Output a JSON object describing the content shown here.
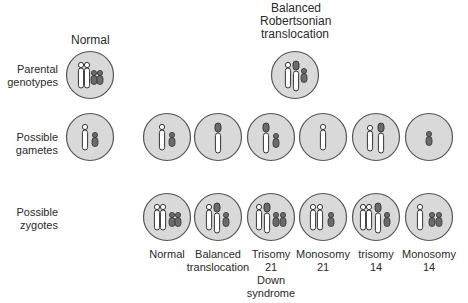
{
  "colors": {
    "background": "#ffffff",
    "cell_fill": "#d9d9d9",
    "cell_stroke": "#555555",
    "chr14_fill": "#ffffff",
    "chr21_fill": "#6b6b6b",
    "outline": "#333333"
  },
  "headers": {
    "normal": "Normal",
    "balanced_line1": "Balanced",
    "balanced_line2": "Robertsonian",
    "balanced_line3": "translocation"
  },
  "row_labels": {
    "parental_line1": "Parental",
    "parental_line2": "genotypes",
    "gametes_line1": "Possible",
    "gametes_line2": "gametes",
    "zygotes_line1": "Possible",
    "zygotes_line2": "zygotes"
  },
  "parents": [
    {
      "name": "normal",
      "chromosomes": [
        "14",
        "14",
        "21",
        "21"
      ]
    },
    {
      "name": "balanced-translocation",
      "chromosomes": [
        "14",
        "14/21",
        "21"
      ]
    }
  ],
  "gametes": [
    {
      "from": "normal",
      "chromosomes": [
        "14",
        "21"
      ]
    },
    {
      "from": "translocation",
      "chromosomes": [
        "14",
        "21"
      ]
    },
    {
      "from": "translocation",
      "chromosomes": [
        "14/21"
      ]
    },
    {
      "from": "translocation",
      "chromosomes": [
        "14/21",
        "21"
      ]
    },
    {
      "from": "translocation",
      "chromosomes": [
        "14"
      ]
    },
    {
      "from": "translocation",
      "chromosomes": [
        "14",
        "14/21"
      ]
    },
    {
      "from": "translocation",
      "chromosomes": [
        "21"
      ]
    }
  ],
  "zygotes": [
    {
      "label1": "Normal",
      "label2": "",
      "label3": "",
      "label4": "",
      "chromosomes": [
        "14",
        "14",
        "21",
        "21"
      ]
    },
    {
      "label1": "Balanced",
      "label2": "translocation",
      "label3": "",
      "label4": "",
      "chromosomes": [
        "14",
        "14/21",
        "21"
      ]
    },
    {
      "label1": "Trisomy",
      "label2": "21",
      "label3": "Down",
      "label4": "syndrome",
      "chromosomes": [
        "14",
        "14/21",
        "21",
        "21"
      ]
    },
    {
      "label1": "Monosomy",
      "label2": "21",
      "label3": "",
      "label4": "",
      "chromosomes": [
        "14",
        "14",
        "21"
      ]
    },
    {
      "label1": "trisomy",
      "label2": "14",
      "label3": "",
      "label4": "",
      "chromosomes": [
        "14",
        "14",
        "14/21",
        "21"
      ]
    },
    {
      "label1": "Monosomy",
      "label2": "14",
      "label3": "",
      "label4": "",
      "chromosomes": [
        "14",
        "21",
        "21"
      ]
    }
  ]
}
